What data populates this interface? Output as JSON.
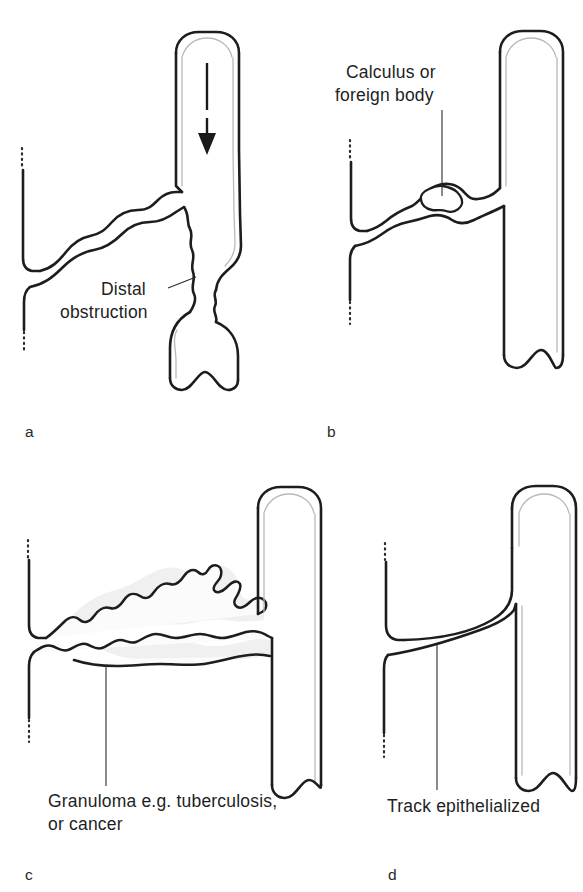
{
  "figure": {
    "background_color": "#ffffff",
    "ink_color": "#1d1d1d",
    "panel_count": 4
  },
  "panels": [
    {
      "letter": "a",
      "caption_label": "Distal obstruction",
      "caption_line_1": "Distal",
      "caption_line_2": "obstruction",
      "annotation": "arrow-down",
      "description": "fistulous track with distal obstruction"
    },
    {
      "letter": "b",
      "caption_label": "Calculus or foreign body",
      "caption_line_1": "Calculus or",
      "caption_line_2": "foreign body",
      "annotation": "calculus-blob",
      "description": "fistulous track containing a calculus or foreign body"
    },
    {
      "letter": "c",
      "caption_label": "Granuloma e.g. tuberculosis, or cancer",
      "caption_line_1": "Granuloma e.g. tuberculosis,",
      "caption_line_2": "or cancer",
      "annotation": "granuloma-mass",
      "description": "fistulous track surrounded by granuloma or cancer"
    },
    {
      "letter": "d",
      "caption_label": "Track epithelialized",
      "caption_line_1": "Track epithelialized",
      "caption_line_2": "",
      "annotation": "epithelial-line",
      "description": "fistulous track lined by epithelium"
    }
  ]
}
